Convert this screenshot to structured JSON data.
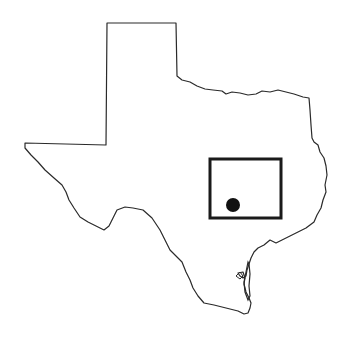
{
  "map": {
    "region": "Texas",
    "background": "#ffffff",
    "outline_color": "#2a2a2a",
    "locator_box": {
      "x": 210,
      "y": 159,
      "width": 71,
      "height": 59,
      "stroke": "#1a1a1a",
      "stroke_width": 3
    },
    "location_marker": {
      "cx": 233,
      "cy": 205,
      "r": 7,
      "fill": "#111111"
    }
  }
}
